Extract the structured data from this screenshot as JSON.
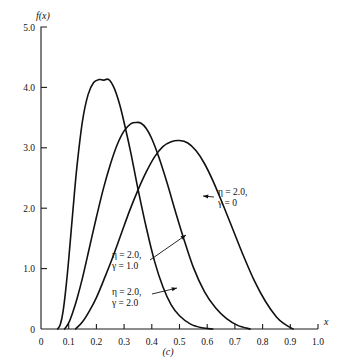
{
  "chart_data": {
    "type": "line",
    "title": "",
    "subtitle": "",
    "caption": "(c)",
    "xlabel": "x",
    "ylabel": "f(x)",
    "xlim": [
      0,
      1.0
    ],
    "ylim": [
      0,
      5.0
    ],
    "grid": false,
    "legend_position": "inline-annotations",
    "x_ticks": [
      "0",
      "0.1",
      "0.2",
      "0.3",
      "0.4",
      "0.5",
      "0.6",
      "0.7",
      "0.8",
      "0.9",
      "1.0"
    ],
    "x_tick_values": [
      0,
      0.1,
      0.2,
      0.3,
      0.4,
      0.5,
      0.6,
      0.7,
      0.8,
      0.9,
      1.0
    ],
    "y_ticks": [
      "0",
      "1.0",
      "2.0",
      "3.0",
      "4.0",
      "5.0"
    ],
    "y_tick_values": [
      0,
      1.0,
      2.0,
      3.0,
      4.0,
      5.0
    ],
    "series": [
      {
        "name": "eta = 2.0, gamma = 0",
        "label_line1": "η = 2.0,",
        "label_line2": "γ = 0",
        "peak_x": 0.245,
        "peak_y": 4.13,
        "x": [
          0.06,
          0.07,
          0.08,
          0.09,
          0.1,
          0.115,
          0.13,
          0.15,
          0.17,
          0.19,
          0.21,
          0.225,
          0.245,
          0.265,
          0.285,
          0.305,
          0.325,
          0.35,
          0.38,
          0.41,
          0.44,
          0.47,
          0.5,
          0.54,
          0.58,
          0.62
        ],
        "y": [
          0.0,
          0.08,
          0.3,
          0.68,
          1.15,
          1.95,
          2.7,
          3.45,
          3.88,
          4.08,
          4.13,
          4.12,
          4.13,
          3.98,
          3.7,
          3.32,
          2.9,
          2.32,
          1.68,
          1.12,
          0.7,
          0.4,
          0.22,
          0.08,
          0.02,
          0.0
        ]
      },
      {
        "name": "eta = 2.0, gamma = 1.0",
        "label_line1": "η = 2.0,",
        "label_line2": "γ = 1.0",
        "peak_x": 0.355,
        "peak_y": 3.42,
        "x": [
          0.085,
          0.1,
          0.115,
          0.13,
          0.15,
          0.175,
          0.2,
          0.225,
          0.25,
          0.275,
          0.3,
          0.325,
          0.345,
          0.36,
          0.38,
          0.4,
          0.425,
          0.455,
          0.485,
          0.515,
          0.55,
          0.59,
          0.63,
          0.67,
          0.71,
          0.755
        ],
        "y": [
          0.0,
          0.1,
          0.28,
          0.5,
          0.85,
          1.35,
          1.85,
          2.32,
          2.72,
          3.05,
          3.28,
          3.4,
          3.42,
          3.41,
          3.32,
          3.15,
          2.85,
          2.42,
          1.95,
          1.5,
          1.02,
          0.62,
          0.35,
          0.17,
          0.06,
          0.0
        ]
      },
      {
        "name": "eta = 2.0, gamma = 2.0",
        "label_line1": "η = 2.0,",
        "label_line2": "γ = 2.0",
        "peak_x": 0.5,
        "peak_y": 3.12,
        "x": [
          0.125,
          0.15,
          0.175,
          0.2,
          0.23,
          0.26,
          0.29,
          0.32,
          0.35,
          0.38,
          0.41,
          0.44,
          0.47,
          0.5,
          0.53,
          0.56,
          0.59,
          0.62,
          0.655,
          0.69,
          0.73,
          0.77,
          0.81,
          0.85,
          0.88,
          0.91
        ],
        "y": [
          0.0,
          0.12,
          0.3,
          0.52,
          0.85,
          1.2,
          1.58,
          1.96,
          2.3,
          2.6,
          2.85,
          3.02,
          3.1,
          3.12,
          3.08,
          2.95,
          2.74,
          2.46,
          2.08,
          1.68,
          1.22,
          0.8,
          0.46,
          0.2,
          0.08,
          0.0
        ]
      }
    ],
    "annotations": [
      {
        "id": "annot-gamma-0",
        "line1": "η = 2.0,",
        "line2": "γ = 0",
        "text_x": 218,
        "text_y": 195,
        "leader_from_x": 214,
        "leader_from_y": 197,
        "leader_to_x": 203,
        "leader_to_y": 196
      },
      {
        "id": "annot-gamma-1",
        "line1": "η = 2.0,",
        "line2": "γ = 1.0",
        "text_x": 112,
        "text_y": 258,
        "leader_from_x": 150,
        "leader_from_y": 260,
        "leader_to_x": 186,
        "leader_to_y": 235
      },
      {
        "id": "annot-gamma-2",
        "line1": "η = 2.0,",
        "line2": "γ = 2.0",
        "text_x": 112,
        "text_y": 295,
        "leader_from_x": 152,
        "leader_from_y": 294,
        "leader_to_x": 177,
        "leader_to_y": 288
      }
    ]
  }
}
